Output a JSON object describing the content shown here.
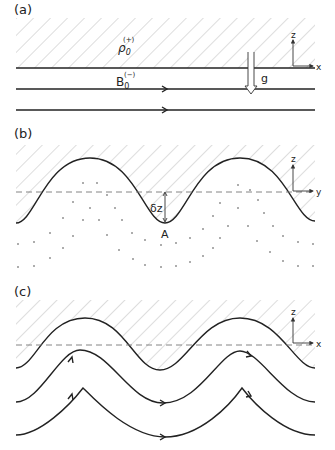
{
  "figure": {
    "panels": [
      {
        "id": "a",
        "label": "(a)",
        "upper_region_label": "ρ",
        "upper_region_sub": "0",
        "upper_region_sup": "(+)",
        "field_label": "B",
        "field_sub": "0",
        "field_sup": "(−)",
        "gravity_label": "g",
        "axes": {
          "vertical": "z",
          "horizontal": "x"
        }
      },
      {
        "id": "b",
        "label": "(b)",
        "displacement_label": "δz",
        "point_label": "A",
        "axes": {
          "vertical": "z",
          "horizontal": "y"
        }
      },
      {
        "id": "c",
        "label": "(c)",
        "axes": {
          "vertical": "z",
          "horizontal": "x"
        }
      }
    ]
  },
  "colors": {
    "line": "#222222",
    "hatch": "#aaaaaa",
    "dashed": "#777777"
  }
}
